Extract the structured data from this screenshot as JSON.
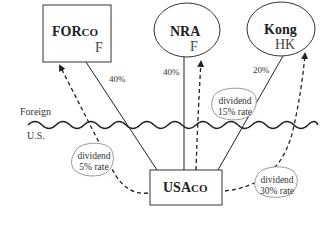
{
  "diagram": {
    "regions": {
      "foreign_label": "Foreign",
      "us_label": "U.S."
    },
    "entities": {
      "forco": {
        "name_main": "FOR",
        "name_suffix": "CO",
        "country": "F",
        "shape": "rectangle"
      },
      "nra": {
        "name": "NRA",
        "country": "F",
        "shape": "ellipse"
      },
      "kong": {
        "name": "Kong",
        "country": "HK",
        "shape": "ellipse"
      },
      "usaco": {
        "name_main": "USA",
        "name_suffix": "CO",
        "shape": "rectangle"
      }
    },
    "ownership": [
      {
        "from": "usaco",
        "to": "forco",
        "percent": "40%"
      },
      {
        "from": "usaco",
        "to": "nra",
        "percent": "40%"
      },
      {
        "from": "usaco",
        "to": "kong",
        "percent": "20%"
      }
    ],
    "dividends": [
      {
        "from": "usaco",
        "to": "forco",
        "line1": "dividend",
        "line2": "5% rate"
      },
      {
        "from": "usaco",
        "to": "nra",
        "line1": "dividend",
        "line2": "15% rate"
      },
      {
        "from": "usaco",
        "to": "kong",
        "line1": "dividend",
        "line2": "30% rate"
      }
    ],
    "colors": {
      "line": "#222222",
      "background": "#ffffff",
      "bubble_stroke": "#888888"
    }
  }
}
